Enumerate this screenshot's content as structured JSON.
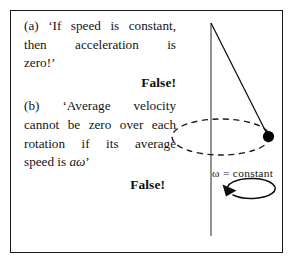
{
  "figure": {
    "background_color": "#ffffff",
    "border_color": "#1a1a1a",
    "ink_color": "#141414"
  },
  "statements": [
    {
      "id": "a",
      "label": "(a)",
      "lines": [
        "(a) ‘If speed is constant,",
        "then acceleration is",
        "zero!’"
      ],
      "full_text": "(a) ‘If speed is constant, then acceleration is zero!’",
      "verdict": "False!"
    },
    {
      "id": "b",
      "label": "(b)",
      "lines": [
        "(b) ‘Average velocity",
        "cannot be zero over each",
        "rotation if its average",
        "speed is aω.’"
      ],
      "full_text": "(b) ‘Average velocity cannot be zero over each rotation if its average speed is aω.’",
      "line4_prefix": "speed is ",
      "line4_italic": "aω",
      "line4_suffix": "’",
      "verdict": "False!"
    }
  ],
  "diagram": {
    "name": "conical-pendulum",
    "axis_label": "ω = constant",
    "axis": {
      "x": 211,
      "y_top": 23,
      "y_bottom": 236
    },
    "cord": {
      "x1": 211,
      "y1": 23,
      "x2": 268,
      "y2": 136
    },
    "bob": {
      "cx": 268.5,
      "cy": 136.5,
      "r": 5.6,
      "color": "#000000"
    },
    "orbit_ellipse": {
      "cx": 221,
      "cy": 137,
      "rx": 49,
      "ry": 18,
      "style": "dashed",
      "dash": "6 4.5"
    },
    "rotation_arrow": {
      "cx": 211,
      "cy": 199,
      "rx": 24,
      "ry": 10,
      "direction": "counterclockwise-viewed-from-above",
      "arrowhead_at": "upper-right"
    }
  }
}
